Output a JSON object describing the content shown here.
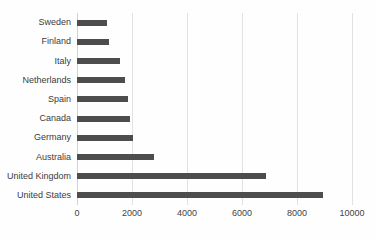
{
  "chart_data": {
    "type": "bar",
    "orientation": "horizontal",
    "title": "",
    "xlabel": "",
    "ylabel": "",
    "categories_top_to_bottom": [
      "Sweden",
      "Finland",
      "Italy",
      "Netherlands",
      "Spain",
      "Canada",
      "Germany",
      "Australia",
      "United Kingdom",
      "United States"
    ],
    "values": [
      1100,
      1150,
      1570,
      1750,
      1870,
      1910,
      2050,
      2790,
      6860,
      8950
    ],
    "xlim": [
      0,
      10000
    ],
    "xticks": [
      0,
      2000,
      4000,
      6000,
      8000,
      10000
    ],
    "xtick_labels": [
      "0",
      "2000",
      "4000",
      "6000",
      "8000",
      "10000"
    ],
    "grid": "vertical-only",
    "legend": "none",
    "bar_color": "#4d4d4d",
    "gridline_color": "#e2e2e0",
    "axis_line_color": "#d2d2d0",
    "text_color": "#3c3c3c"
  }
}
